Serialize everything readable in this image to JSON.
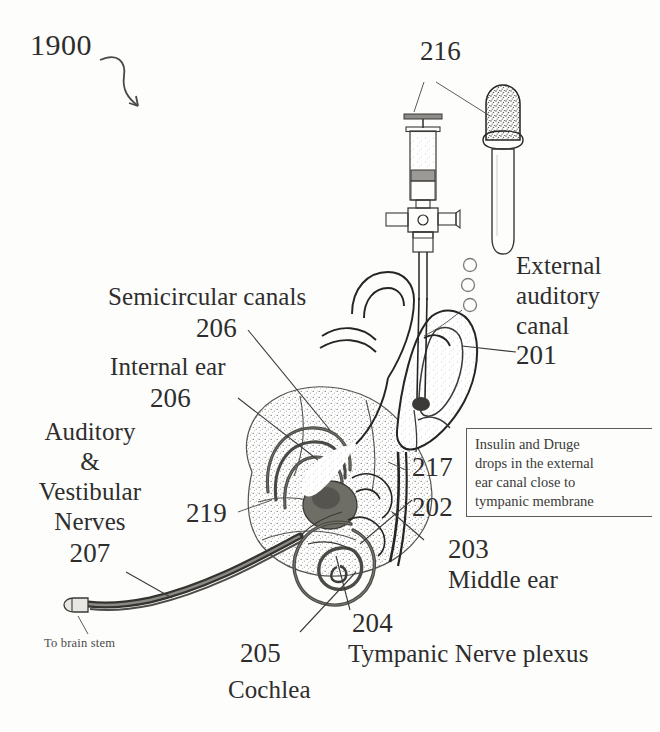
{
  "figure": {
    "number": "1900",
    "arrow_icon": "curved-arrow-icon"
  },
  "labels": {
    "syringe_and_dropper": {
      "ref": "216",
      "name": "",
      "icons": [
        "syringe-icon",
        "dropper-icon"
      ]
    },
    "external_auditory_canal": {
      "line1": "External",
      "line2": "auditory",
      "line3": "canal",
      "ref": "201"
    },
    "semicircular_canals": {
      "name": "Semicircular canals",
      "ref": "206"
    },
    "internal_ear": {
      "name": "Internal ear",
      "ref": "206"
    },
    "auditory_vestibular_nerves": {
      "line1": "Auditory",
      "line2": "&",
      "line3": "Vestibular",
      "line4": "Nerves",
      "ref": "207"
    },
    "to_brain_stem": {
      "name": "To brain stem"
    },
    "ref_219": {
      "ref": "219"
    },
    "ref_217": {
      "ref": "217"
    },
    "ref_202": {
      "ref": "202"
    },
    "middle_ear": {
      "ref": "203",
      "name": "Middle ear"
    },
    "tympanic_nerve_plexus": {
      "ref": "204",
      "name": "Tympanic Nerve plexus"
    },
    "cochlea": {
      "ref": "205",
      "name": "Cochlea"
    }
  },
  "callout": {
    "line1": "Insulin and Druge",
    "line2": "drops in the external",
    "line3": "ear canal close to",
    "line4": "tympanic membrane"
  },
  "colors": {
    "ink": "#3a3937",
    "ink_dark": "#262524",
    "text": "#2e2d2c",
    "background": "#fdfdfc",
    "stipple": "#6f6e6b"
  },
  "illustration": {
    "parts": [
      "syringe-icon",
      "dropper-icon",
      "droplets-icon",
      "pinna-icon",
      "ear-canal-icon",
      "semicircular-canals-icon",
      "cochlea-spiral-icon",
      "nerve-bundle-icon",
      "delivery-tube-icon"
    ]
  }
}
